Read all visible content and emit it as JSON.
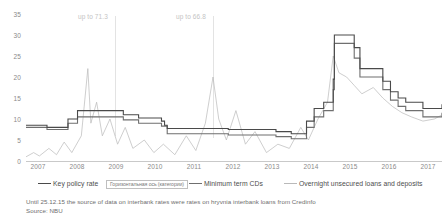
{
  "chart_data": {
    "type": "line",
    "title": "",
    "xlabel": "",
    "ylabel": "",
    "ylim": [
      0,
      35
    ],
    "yticks": [
      0,
      5,
      10,
      15,
      20,
      25,
      30,
      35
    ],
    "xlim": [
      2007,
      2017.9
    ],
    "xticks": [
      "2007",
      "2008",
      "2009",
      "2010",
      "2011",
      "2012",
      "2013",
      "2014",
      "2015",
      "2016",
      "2017"
    ],
    "grid": false,
    "legend_position": "bottom",
    "annotations": [
      {
        "text": "up to 71.3",
        "x": 2008.6,
        "y": 35.5
      },
      {
        "text": "up to 66.8",
        "x": 2011.9,
        "y": 35.5
      }
    ],
    "series": [
      {
        "name": "Key policy rate",
        "color": "#4a4a4a",
        "points": [
          [
            2007.0,
            8.5
          ],
          [
            2007.5,
            8.5
          ],
          [
            2007.55,
            8.0
          ],
          [
            2008.05,
            8.0
          ],
          [
            2008.1,
            10.0
          ],
          [
            2008.35,
            12.0
          ],
          [
            2009.0,
            12.0
          ],
          [
            2009.55,
            11.0
          ],
          [
            2009.95,
            10.25
          ],
          [
            2010.55,
            9.5
          ],
          [
            2010.63,
            8.5
          ],
          [
            2010.7,
            7.75
          ],
          [
            2012.2,
            7.75
          ],
          [
            2012.3,
            7.5
          ],
          [
            2013.55,
            7.0
          ],
          [
            2013.95,
            6.5
          ],
          [
            2014.3,
            6.5
          ],
          [
            2014.35,
            9.5
          ],
          [
            2014.55,
            12.5
          ],
          [
            2014.8,
            14.0
          ],
          [
            2015.05,
            19.5
          ],
          [
            2015.08,
            30.0
          ],
          [
            2015.35,
            30.0
          ],
          [
            2015.6,
            27.0
          ],
          [
            2015.75,
            22.0
          ],
          [
            2016.2,
            22.0
          ],
          [
            2016.35,
            19.0
          ],
          [
            2016.55,
            16.5
          ],
          [
            2016.75,
            15.0
          ],
          [
            2016.95,
            14.0
          ],
          [
            2017.4,
            12.5
          ],
          [
            2017.75,
            12.5
          ],
          [
            2017.9,
            13.5
          ]
        ]
      },
      {
        "name": "Minimum term CDs",
        "color": "#6f6f6f",
        "points": [
          [
            2007.0,
            8.0
          ],
          [
            2007.55,
            7.5
          ],
          [
            2008.05,
            7.5
          ],
          [
            2008.1,
            9.0
          ],
          [
            2008.35,
            10.5
          ],
          [
            2009.0,
            10.5
          ],
          [
            2009.55,
            9.8
          ],
          [
            2009.95,
            9.0
          ],
          [
            2010.55,
            8.3
          ],
          [
            2010.7,
            6.5
          ],
          [
            2012.2,
            6.5
          ],
          [
            2012.3,
            6.2
          ],
          [
            2013.55,
            5.8
          ],
          [
            2013.95,
            5.3
          ],
          [
            2014.3,
            5.3
          ],
          [
            2014.35,
            8.0
          ],
          [
            2014.55,
            10.5
          ],
          [
            2014.8,
            12.0
          ],
          [
            2015.05,
            17.0
          ],
          [
            2015.08,
            28.0
          ],
          [
            2015.35,
            28.0
          ],
          [
            2015.6,
            24.5
          ],
          [
            2015.75,
            20.0
          ],
          [
            2016.2,
            20.0
          ],
          [
            2016.35,
            17.0
          ],
          [
            2016.55,
            14.5
          ],
          [
            2016.75,
            13.0
          ],
          [
            2016.95,
            12.0
          ],
          [
            2017.4,
            10.5
          ],
          [
            2017.75,
            10.5
          ],
          [
            2017.9,
            11.5
          ]
        ]
      },
      {
        "name": "Overnight unsecured loans and deposits",
        "color": "#b9b9b9",
        "points": [
          [
            2007.0,
            1.0
          ],
          [
            2007.2,
            2.0
          ],
          [
            2007.35,
            1.2
          ],
          [
            2007.6,
            3.0
          ],
          [
            2007.8,
            1.5
          ],
          [
            2008.0,
            4.5
          ],
          [
            2008.2,
            2.0
          ],
          [
            2008.45,
            6.0
          ],
          [
            2008.62,
            22.0
          ],
          [
            2008.7,
            9.0
          ],
          [
            2008.85,
            14.0
          ],
          [
            2009.0,
            6.0
          ],
          [
            2009.2,
            10.0
          ],
          [
            2009.4,
            4.0
          ],
          [
            2009.6,
            8.0
          ],
          [
            2009.8,
            3.0
          ],
          [
            2010.1,
            5.0
          ],
          [
            2010.35,
            2.0
          ],
          [
            2010.6,
            4.0
          ],
          [
            2010.9,
            1.5
          ],
          [
            2011.2,
            6.0
          ],
          [
            2011.45,
            2.5
          ],
          [
            2011.7,
            9.0
          ],
          [
            2011.9,
            20.0
          ],
          [
            2012.05,
            10.0
          ],
          [
            2012.25,
            5.0
          ],
          [
            2012.5,
            12.0
          ],
          [
            2012.75,
            4.0
          ],
          [
            2013.0,
            7.0
          ],
          [
            2013.3,
            2.0
          ],
          [
            2013.6,
            4.0
          ],
          [
            2013.9,
            3.0
          ],
          [
            2014.2,
            8.0
          ],
          [
            2014.4,
            5.0
          ],
          [
            2014.65,
            10.0
          ],
          [
            2014.9,
            14.0
          ],
          [
            2015.05,
            25.0
          ],
          [
            2015.2,
            21.0
          ],
          [
            2015.4,
            20.0
          ],
          [
            2015.6,
            18.0
          ],
          [
            2015.8,
            16.0
          ],
          [
            2016.1,
            17.5
          ],
          [
            2016.35,
            15.0
          ],
          [
            2016.6,
            13.0
          ],
          [
            2016.85,
            11.5
          ],
          [
            2017.1,
            10.5
          ],
          [
            2017.4,
            9.5
          ],
          [
            2017.7,
            10.0
          ],
          [
            2017.9,
            11.0
          ]
        ]
      }
    ]
  },
  "legend": {
    "items": [
      {
        "label": "Key policy rate",
        "swatch": "dark"
      },
      {
        "label": "Minimum term CDs",
        "swatch": "mid"
      },
      {
        "label": "Overnight unsecured loans and deposits",
        "swatch": "light"
      }
    ],
    "axis_placeholder": "Горизонтальная ось (категории)"
  },
  "footnote": {
    "line1": "Until 25.12.15 the source of data on interbank rates were rates on hryvnia interbank loans from Credinfo",
    "line2": "Source: NBU"
  },
  "colors": {
    "key_policy_rate": "#4a4a4a",
    "minimum_term_cds": "#6f6f6f",
    "overnight": "#b9b9b9",
    "axis": "#c9c9c9",
    "tick_text": "#8a8a8a",
    "annotation": "#c4c4c4"
  }
}
